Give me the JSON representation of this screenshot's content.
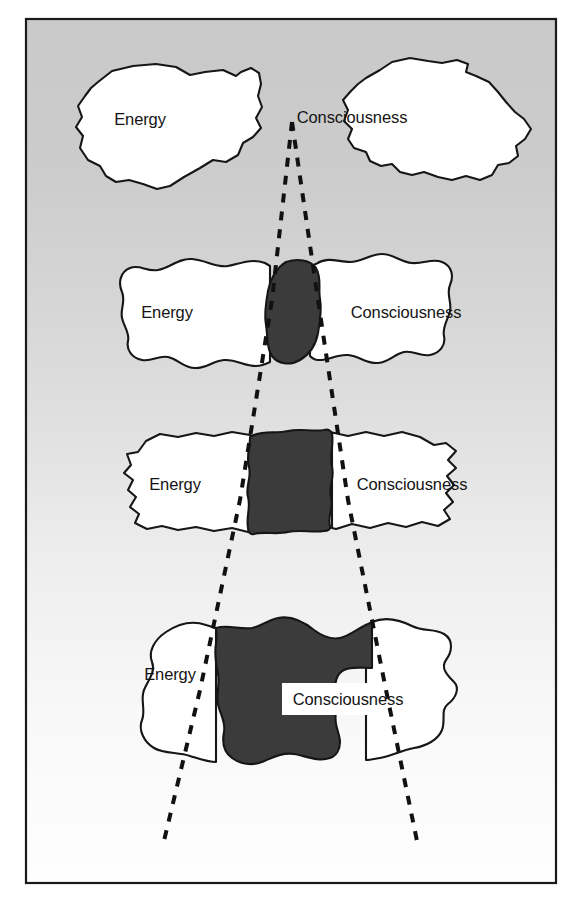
{
  "figure": {
    "frame": {
      "x": 25,
      "y": 18,
      "width": 532,
      "height": 866,
      "border_color": "#1a1a1a",
      "border_width": 2
    },
    "background": {
      "top_color": "#cbcbcb",
      "bottom_color": "#fdfdfd",
      "gradient_direction": "vertical"
    },
    "colors": {
      "blob_fill": "#ffffff",
      "blob_outline": "#161616",
      "overlap_fill": "#3b3b3b",
      "dashed_line": "#111111",
      "label_text": "#141414"
    },
    "labels": {
      "energy": "Energy",
      "consciousness": "Consciousness"
    },
    "cone": {
      "apex_x": 292,
      "apex_y": 122,
      "left_end_x": 163,
      "left_end_y": 845,
      "right_end_x": 417,
      "right_end_y": 841,
      "dash_pattern": "9 9",
      "stroke_width": 4
    },
    "rows": [
      {
        "id": "row-1",
        "stage": "separate",
        "overlap_label": "none",
        "overlap_percent": 0,
        "energy_label": "Energy",
        "consciousness_label": "Consciousness",
        "energy_label_x": 140,
        "energy_label_y": 125,
        "consciousness_label_x": 352,
        "consciousness_label_y": 123
      },
      {
        "id": "row-2",
        "stage": "slight-overlap",
        "overlap_label": "small",
        "overlap_percent": 12,
        "energy_label": "Energy",
        "consciousness_label": "Consciousness",
        "energy_label_x": 167,
        "energy_label_y": 318,
        "consciousness_label_x": 344,
        "consciousness_label_y": 318
      },
      {
        "id": "row-3",
        "stage": "moderate-overlap",
        "overlap_label": "medium",
        "overlap_percent": 32,
        "energy_label": "Energy",
        "consciousness_label": "Consciousness",
        "energy_label_x": 175,
        "energy_label_y": 490,
        "consciousness_label_x": 352,
        "consciousness_label_y": 490
      },
      {
        "id": "row-4",
        "stage": "large-overlap",
        "overlap_label": "large",
        "overlap_percent": 58,
        "energy_label": "Energy",
        "consciousness_label": "Consciousness",
        "energy_label_x": 170,
        "energy_label_y": 680,
        "consciousness_label_x": 335,
        "consciousness_label_y": 700
      }
    ]
  }
}
